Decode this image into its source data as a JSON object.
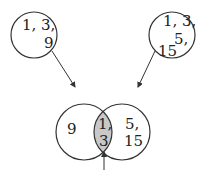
{
  "diagram": {
    "type": "venn-merge",
    "colors": {
      "stroke": "#333333",
      "intersection_fill": "#c8c8c8",
      "background": "#ffffff"
    },
    "source_sets": [
      {
        "name": "set-a",
        "elements_text": [
          "1, 3,",
          "9"
        ]
      },
      {
        "name": "set-b",
        "elements_text": [
          "1, 3,",
          "5,",
          "15"
        ]
      }
    ],
    "venn": {
      "left_only": "9",
      "intersection": [
        "1,",
        "3"
      ],
      "right_only": [
        "5,",
        "15"
      ]
    }
  }
}
